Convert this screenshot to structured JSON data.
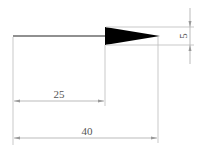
{
  "drawing": {
    "type": "arrow-dimension-drawing",
    "colors": {
      "shape": "#000000",
      "dimension_line": "#aaaaaa",
      "text": "#555555",
      "background": "#ffffff"
    },
    "dimensions": {
      "shaft_length": "25",
      "total_length": "40",
      "head_width": "5"
    }
  }
}
